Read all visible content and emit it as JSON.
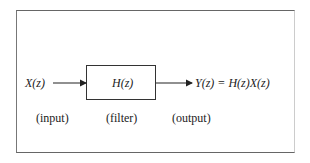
{
  "diagram": {
    "input": {
      "symbol": "X(z)",
      "caption": "(input)"
    },
    "filter": {
      "symbol": "H(z)",
      "caption": "(filter)"
    },
    "output": {
      "equation": "Y(z) = H(z)X(z)",
      "caption": "(output)"
    }
  },
  "edges": [
    {
      "from": "input",
      "to": "filter"
    },
    {
      "from": "filter",
      "to": "output"
    }
  ]
}
